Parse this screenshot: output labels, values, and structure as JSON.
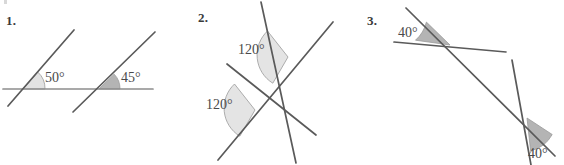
{
  "page": {
    "background_color": "#ffffff",
    "line_color": "#5a5a5a",
    "text_color": "#4a4a4a",
    "wedge_light_color": "#e2e2e2",
    "wedge_dark_color": "#b4b4b4",
    "wedge_stroke_color": "#9a9a9a"
  },
  "problems": [
    {
      "number": "1.",
      "angles": [
        {
          "value": "50°",
          "shade": "light"
        },
        {
          "value": "45°",
          "shade": "dark"
        }
      ]
    },
    {
      "number": "2.",
      "angles": [
        {
          "value": "120°",
          "shade": "light"
        },
        {
          "value": "120°",
          "shade": "light"
        }
      ]
    },
    {
      "number": "3.",
      "angles": [
        {
          "value": "40°",
          "shade": "dark"
        },
        {
          "value": "40°",
          "shade": "dark"
        }
      ]
    }
  ]
}
